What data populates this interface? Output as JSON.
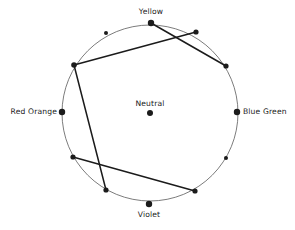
{
  "figure": {
    "name": "color-wheel-harmony-diagram",
    "background_color": "#ffffff",
    "stroke_color": "#1b1b1b",
    "circle_stroke_color": "#5a5a5a"
  },
  "labels": {
    "yellow": "Yellow",
    "violet": "Violet",
    "red_orange": "Red Orange",
    "blue_green": "Blue Green",
    "neutral": "Neutral"
  },
  "chart_data": {
    "type": "scatter",
    "title": "",
    "xlabel": "",
    "ylabel": "",
    "grid": false,
    "legend": "none",
    "circle": {
      "cx": 150,
      "cy": 113,
      "r": 88,
      "stroke": "#5a5a5a",
      "stroke_width": 0.8
    },
    "center_point": {
      "name": "Neutral",
      "x": 150,
      "y": 113,
      "labeled": true
    },
    "points": [
      {
        "name": "Yellow",
        "x": 151,
        "y": 23,
        "labeled": true,
        "size": 3.2
      },
      {
        "name": "Blue Green",
        "x": 237,
        "y": 112,
        "labeled": true,
        "size": 3.2
      },
      {
        "name": "Violet",
        "x": 149,
        "y": 204,
        "labeled": true,
        "size": 3.2
      },
      {
        "name": "Red Orange",
        "x": 62,
        "y": 112,
        "labeled": true,
        "size": 3.2
      },
      {
        "name": "unlabeled-upper-left",
        "x": 106,
        "y": 33,
        "labeled": false,
        "size": 2.0
      },
      {
        "name": "unlabeled-upper-right",
        "x": 196,
        "y": 32,
        "labeled": false,
        "size": 2.6
      },
      {
        "name": "unlabeled-right-upper",
        "x": 226,
        "y": 66,
        "labeled": false,
        "size": 2.6
      },
      {
        "name": "unlabeled-right-lower",
        "x": 226,
        "y": 158,
        "labeled": false,
        "size": 2.0
      },
      {
        "name": "unlabeled-left-vertex",
        "x": 74,
        "y": 65,
        "labeled": false,
        "size": 2.8
      },
      {
        "name": "unlabeled-lower-left",
        "x": 73,
        "y": 157,
        "labeled": false,
        "size": 2.6
      },
      {
        "name": "unlabeled-bottom-left",
        "x": 106,
        "y": 190,
        "labeled": false,
        "size": 2.6
      },
      {
        "name": "unlabeled-bottom-right",
        "x": 195,
        "y": 191,
        "labeled": false,
        "size": 2.6
      }
    ],
    "chords": [
      {
        "name": "yellow-to-right-lower",
        "x1": 151,
        "y1": 23,
        "x2": 226,
        "y2": 66
      },
      {
        "name": "upper-right-to-left-vertex",
        "x1": 196,
        "y1": 32,
        "x2": 74,
        "y2": 65
      },
      {
        "name": "left-vertex-to-bottom-left",
        "x1": 74,
        "y1": 65,
        "x2": 106,
        "y2": 190
      },
      {
        "name": "lower-left-to-bottom-right",
        "x1": 73,
        "y1": 157,
        "x2": 195,
        "y2": 191
      }
    ]
  }
}
